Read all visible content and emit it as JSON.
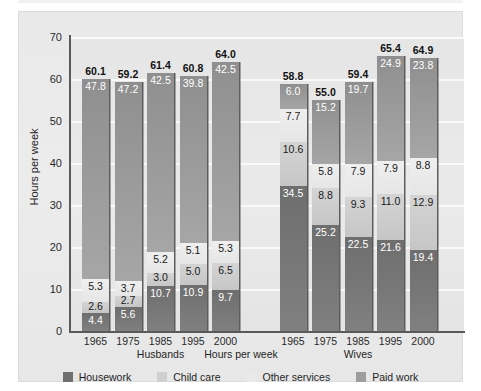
{
  "chart_data": {
    "type": "bar",
    "subtype": "stacked-bar-grouped",
    "title": "",
    "xlabel": "Hours per week",
    "ylabel": "Hours per week",
    "ylim": [
      0,
      70
    ],
    "ytick_labels": [
      "0",
      "10",
      "20",
      "30",
      "40",
      "50",
      "60",
      "70"
    ],
    "ytick_values": [
      0,
      10,
      20,
      30,
      40,
      50,
      60,
      70
    ],
    "grid": true,
    "legend_position": "bottom",
    "legend": [
      "Housework",
      "Child care",
      "Other services",
      "Paid work"
    ],
    "series": [
      {
        "name": "Housework",
        "color": "#6f6f6f",
        "label_color": "#ffffff",
        "values": [
          4.4,
          5.6,
          10.7,
          10.9,
          9.7,
          34.5,
          25.2,
          22.5,
          21.6,
          19.4
        ]
      },
      {
        "name": "Child care",
        "color": "#cfcfcf",
        "label_color": "#1a1a1a",
        "values": [
          2.6,
          2.7,
          3.0,
          5.0,
          6.5,
          10.6,
          8.8,
          9.3,
          11.0,
          12.9
        ]
      },
      {
        "name": "Other services",
        "color": "#e9e9e9",
        "label_color": "#1a1a1a",
        "values": [
          5.3,
          3.7,
          5.2,
          5.1,
          5.3,
          7.7,
          5.8,
          7.9,
          7.9,
          8.8
        ]
      },
      {
        "name": "Paid work",
        "color": "#9d9d9d",
        "label_color": "#ffffff",
        "values": [
          47.8,
          47.2,
          42.5,
          39.8,
          42.5,
          6.0,
          15.2,
          19.7,
          24.9,
          23.8
        ]
      }
    ],
    "bars": [
      {
        "group": "Husbands",
        "category": "1965",
        "total": "60.1",
        "segments": [
          {
            "series": "Housework",
            "value": 4.4,
            "label": "4.4",
            "label_color": "light"
          },
          {
            "series": "Child care",
            "value": 2.6,
            "label": "2.6",
            "label_color": "dark"
          },
          {
            "series": "Other services",
            "value": 5.3,
            "label": "5.3",
            "label_color": "dark"
          },
          {
            "series": "Paid work",
            "value": 47.8,
            "label": "47.8",
            "label_color": "light"
          }
        ]
      },
      {
        "group": "Husbands",
        "category": "1975",
        "total": "59.2",
        "segments": [
          {
            "series": "Housework",
            "value": 5.6,
            "label": "5.6",
            "label_color": "light"
          },
          {
            "series": "Child care",
            "value": 2.7,
            "label": "2.7",
            "label_color": "dark"
          },
          {
            "series": "Other services",
            "value": 3.7,
            "label": "3.7",
            "label_color": "dark"
          },
          {
            "series": "Paid work",
            "value": 47.2,
            "label": "47.2",
            "label_color": "light"
          }
        ]
      },
      {
        "group": "Husbands",
        "category": "1985",
        "total": "61.4",
        "segments": [
          {
            "series": "Housework",
            "value": 10.7,
            "label": "10.7",
            "label_color": "light"
          },
          {
            "series": "Child care",
            "value": 3.0,
            "label": "3.0",
            "label_color": "dark"
          },
          {
            "series": "Other services",
            "value": 5.2,
            "label": "5.2",
            "label_color": "dark"
          },
          {
            "series": "Paid work",
            "value": 42.5,
            "label": "42.5",
            "label_color": "light"
          }
        ]
      },
      {
        "group": "Husbands",
        "category": "1995",
        "total": "60.8",
        "segments": [
          {
            "series": "Housework",
            "value": 10.9,
            "label": "10.9",
            "label_color": "light"
          },
          {
            "series": "Child care",
            "value": 5.0,
            "label": "5.0",
            "label_color": "dark"
          },
          {
            "series": "Other services",
            "value": 5.1,
            "label": "5.1",
            "label_color": "dark"
          },
          {
            "series": "Paid work",
            "value": 39.8,
            "label": "39.8",
            "label_color": "light"
          }
        ]
      },
      {
        "group": "Husbands",
        "category": "2000",
        "total": "64.0",
        "segments": [
          {
            "series": "Housework",
            "value": 9.7,
            "label": "9.7",
            "label_color": "light"
          },
          {
            "series": "Child care",
            "value": 6.5,
            "label": "6.5",
            "label_color": "dark"
          },
          {
            "series": "Other services",
            "value": 5.3,
            "label": "5.3",
            "label_color": "dark"
          },
          {
            "series": "Paid work",
            "value": 42.5,
            "label": "42.5",
            "label_color": "light"
          }
        ]
      },
      {
        "group": "Wives",
        "category": "1965",
        "total": "58.8",
        "segments": [
          {
            "series": "Housework",
            "value": 34.5,
            "label": "34.5",
            "label_color": "light"
          },
          {
            "series": "Child care",
            "value": 10.6,
            "label": "10.6",
            "label_color": "dark"
          },
          {
            "series": "Other services",
            "value": 7.7,
            "label": "7.7",
            "label_color": "dark"
          },
          {
            "series": "Paid work",
            "value": 6.0,
            "label": "6.0",
            "label_color": "light"
          }
        ]
      },
      {
        "group": "Wives",
        "category": "1975",
        "total": "55.0",
        "segments": [
          {
            "series": "Housework",
            "value": 25.2,
            "label": "25.2",
            "label_color": "light"
          },
          {
            "series": "Child care",
            "value": 8.8,
            "label": "8.8",
            "label_color": "dark"
          },
          {
            "series": "Other services",
            "value": 5.8,
            "label": "5.8",
            "label_color": "dark"
          },
          {
            "series": "Paid work",
            "value": 15.2,
            "label": "15.2",
            "label_color": "light"
          }
        ]
      },
      {
        "group": "Wives",
        "category": "1985",
        "total": "59.4",
        "segments": [
          {
            "series": "Housework",
            "value": 22.5,
            "label": "22.5",
            "label_color": "light"
          },
          {
            "series": "Child care",
            "value": 9.3,
            "label": "9.3",
            "label_color": "dark"
          },
          {
            "series": "Other services",
            "value": 7.9,
            "label": "7.9",
            "label_color": "dark"
          },
          {
            "series": "Paid work",
            "value": 19.7,
            "label": "19.7",
            "label_color": "light"
          }
        ]
      },
      {
        "group": "Wives",
        "category": "1995",
        "total": "65.4",
        "segments": [
          {
            "series": "Housework",
            "value": 21.6,
            "label": "21.6",
            "label_color": "light"
          },
          {
            "series": "Child care",
            "value": 11.0,
            "label": "11.0",
            "label_color": "dark"
          },
          {
            "series": "Other services",
            "value": 7.9,
            "label": "7.9",
            "label_color": "dark"
          },
          {
            "series": "Paid work",
            "value": 24.9,
            "label": "24.9",
            "label_color": "light"
          }
        ]
      },
      {
        "group": "Wives",
        "category": "2000",
        "total": "64.9",
        "segments": [
          {
            "series": "Housework",
            "value": 19.4,
            "label": "19.4",
            "label_color": "light"
          },
          {
            "series": "Child care",
            "value": 12.9,
            "label": "12.9",
            "label_color": "dark"
          },
          {
            "series": "Other services",
            "value": 8.8,
            "label": "8.8",
            "label_color": "dark"
          },
          {
            "series": "Paid work",
            "value": 23.8,
            "label": "23.8",
            "label_color": "light"
          }
        ]
      }
    ],
    "group_labels": [
      "Husbands",
      "Wives"
    ]
  }
}
